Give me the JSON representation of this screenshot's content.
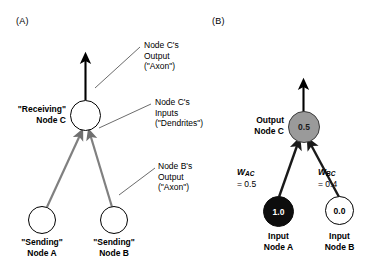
{
  "figure": {
    "width": 389,
    "height": 272,
    "background": "#ffffff"
  },
  "panel_a": {
    "label": "(A)",
    "node_c_label": "\"Receiving\"\nNode C",
    "node_a_label": "\"Sending\"\nNode A",
    "node_b_label": "\"Sending\"\nNode B",
    "callout_output": "Node C's\nOutput\n(\"Axon\")",
    "callout_inputs": "Node C's\nInputs\n(\"Dendrites\")",
    "callout_node_b_output": "Node B's\nOutput\n(\"Axon\")",
    "node_fill": "#ffffff",
    "node_stroke": "#000000",
    "edge_color": "#808080",
    "axon_color": "#000000",
    "leader_color": "#5a5a5a"
  },
  "panel_b": {
    "label": "(B)",
    "node_c_label": "Output\nNode C",
    "node_c_value": "0.5",
    "node_a_label": "Input\nNode A",
    "node_a_value": "1.0",
    "node_b_label": "Input\nNode B",
    "node_b_value": "0.0",
    "weight_ac_symbol": "W",
    "weight_ac_sub": "AC",
    "weight_ac_value": "= 0.5",
    "weight_bc_symbol": "W",
    "weight_bc_sub": "BC",
    "weight_bc_value": "= 0.4",
    "node_c_fill": "#9a9a9a",
    "node_a_fill": "#0d0d0d",
    "node_b_fill": "#ffffff",
    "edge_color": "#1a1a1a",
    "axon_color": "#000000"
  }
}
